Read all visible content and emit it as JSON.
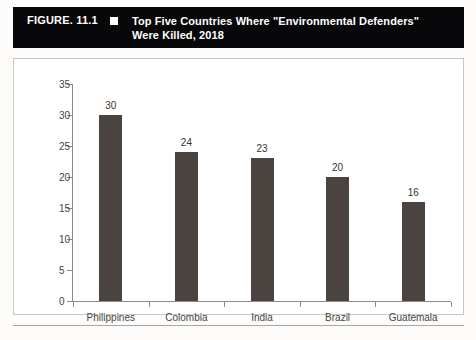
{
  "header": {
    "figure_number": "FIGURE. 11.1",
    "bullet": "square-bullet",
    "title_line1": "Top Five Countries Where \"Environmental Defenders\"",
    "title_line2": "Were Killed, 2018",
    "background_color": "#08070a",
    "text_color": "#ffffff"
  },
  "chart_data": {
    "type": "bar",
    "title": "Top Five Countries Where \"Environmental Defenders\" Were Killed, 2018",
    "categories": [
      "Philippines",
      "Colombia",
      "India",
      "Brazil",
      "Guatemala"
    ],
    "values": [
      30,
      24,
      23,
      20,
      16
    ],
    "xlabel": "",
    "ylabel": "",
    "ylim": [
      0,
      35
    ],
    "yticks": [
      0,
      5,
      10,
      15,
      20,
      25,
      30,
      35
    ],
    "ytick_labels": [
      "0",
      "5",
      "10",
      "15",
      "20",
      "25",
      "30",
      "35"
    ],
    "value_labels": [
      "30",
      "24",
      "23",
      "20",
      "16"
    ],
    "grid": false,
    "legend": false,
    "bar_color": "#4b433f",
    "axis_color": "#8d8b88",
    "plot_background": "#ffffff"
  }
}
